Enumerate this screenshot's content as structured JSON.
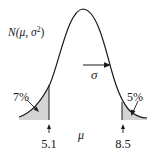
{
  "figure": {
    "distribution_label": "N(μ, σ²)",
    "distribution_label_parts": {
      "prefix": "N(",
      "mu": "μ",
      "sep": ", ",
      "sigma": "σ",
      "exp": "2",
      "suffix": ")"
    },
    "sigma_label": "σ",
    "mean_label": "μ",
    "left_tail": {
      "percent_label": "7%",
      "cutoff_label": "5.1",
      "cutoff_value": 5.1,
      "area_percent": 7
    },
    "right_tail": {
      "percent_label": "5%",
      "cutoff_label": "8.5",
      "cutoff_value": 8.5,
      "area_percent": 5
    },
    "colors": {
      "curve": "#1a1a1a",
      "shade": "#d4d4d4",
      "text": "#1a1a1a"
    }
  }
}
